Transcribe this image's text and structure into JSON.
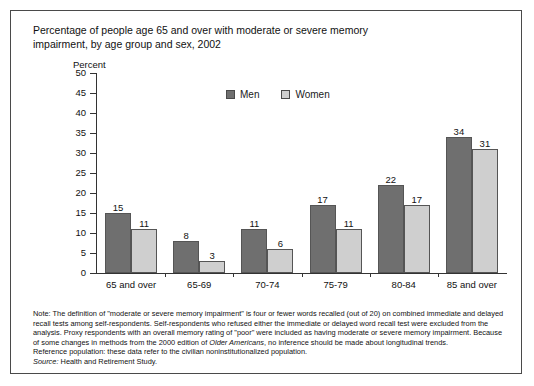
{
  "figure": {
    "title_line1": "Percentage of people age 65 and over with moderate or severe memory",
    "title_line2": "impairment, by age group and sex, 2002",
    "axis_unit": "Percent",
    "note_label": "Note:",
    "note_body": " The definition of \"moderate or severe memory impairment\" is four or fewer words recalled (out of 20) on combined immediate and delayed recall tests among self-respondents. Self-respondents who refused either the immediate or delayed word recall test were excluded from the analysis. Proxy respondents with an overall memory rating of \"poor\" were included as having moderate or severe memory impairment. Because of some changes in methods from the 2000 edition of ",
    "note_italic": "Older Americans",
    "note_body2": ", no inference should be made about longitudinal trends.",
    "reference": "Reference population: these data refer to the civilian noninstitutionalized population.",
    "source_label": "Source:",
    "source_text": " Health and Retirement Study.",
    "colors": {
      "men": "#6f6f6f",
      "women": "#cfcfcf",
      "bar_border": "#555555",
      "axis": "#333333",
      "frame": "#4a4a4a"
    }
  },
  "chart_data": {
    "type": "bar",
    "title": "Percentage of people age 65 and over with moderate or severe memory impairment, by age group and sex, 2002",
    "xlabel": "",
    "ylabel": "Percent",
    "ylim": [
      0,
      50
    ],
    "yticks": [
      0,
      5,
      10,
      15,
      20,
      25,
      30,
      35,
      40,
      45,
      50
    ],
    "ytick_labels": [
      "0",
      "5",
      "10",
      "15",
      "20",
      "25",
      "30",
      "35",
      "40",
      "45",
      "50"
    ],
    "grid": false,
    "legend_position": "top-center",
    "categories": [
      "65 and over",
      "65-69",
      "70-74",
      "75-79",
      "80-84",
      "85 and over"
    ],
    "series": [
      {
        "name": "Men",
        "color": "#6f6f6f",
        "values": [
          15,
          8,
          11,
          17,
          22,
          34
        ]
      },
      {
        "name": "Women",
        "color": "#cfcfcf",
        "values": [
          11,
          3,
          6,
          11,
          17,
          31
        ]
      }
    ]
  }
}
